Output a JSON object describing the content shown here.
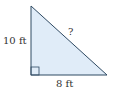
{
  "diagram": {
    "type": "right-triangle",
    "labels": {
      "vertical_leg": "10 ft",
      "horizontal_leg": "8 ft",
      "hypotenuse": "?"
    },
    "colors": {
      "fill": "#e0ecf8",
      "stroke": "#2f4a63",
      "text": "#333333"
    }
  }
}
